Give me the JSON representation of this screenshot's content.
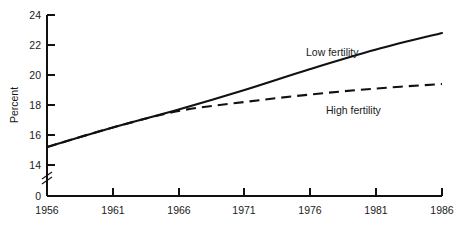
{
  "chart_data": {
    "type": "line",
    "title": "",
    "xlabel": "",
    "ylabel": "Percent",
    "xlim": [
      1956,
      1986
    ],
    "ylim": [
      14,
      24
    ],
    "y_axis_broken": true,
    "y_break_between": [
      0,
      14
    ],
    "grid": false,
    "legend_position": "inline-annotation",
    "xticks": [
      "1956",
      "1961",
      "1966",
      "1971",
      "1976",
      "1981",
      "1986"
    ],
    "xtick_values": [
      1956,
      1961,
      1966,
      1971,
      1976,
      1981,
      1986
    ],
    "yticks": [
      "0",
      "14",
      "16",
      "18",
      "20",
      "22",
      "24"
    ],
    "ytick_values": [
      0,
      14,
      16,
      18,
      20,
      22,
      24
    ],
    "x": [
      1956,
      1961,
      1966,
      1971,
      1976,
      1981,
      1986
    ],
    "series": [
      {
        "name": "Low fertility",
        "style": "solid",
        "color": "#111111",
        "values": [
          15.2,
          16.5,
          17.7,
          19.0,
          20.4,
          21.7,
          22.8
        ]
      },
      {
        "name": "High fertility",
        "style": "dashed",
        "color": "#111111",
        "values": [
          15.2,
          16.5,
          17.6,
          18.2,
          18.7,
          19.1,
          19.4
        ]
      }
    ],
    "annotations": [
      {
        "text": "Low fertility",
        "x": 1976,
        "y": 21.8
      },
      {
        "text": "High fertility",
        "x": 1978,
        "y": 18.0
      }
    ]
  },
  "axis": {
    "y_label": "Percent",
    "ytick_0": "0",
    "ytick_14": "14",
    "ytick_16": "16",
    "ytick_18": "18",
    "ytick_20": "20",
    "ytick_22": "22",
    "ytick_24": "24",
    "xtick_1956": "1956",
    "xtick_1961": "1961",
    "xtick_1966": "1966",
    "xtick_1971": "1971",
    "xtick_1976": "1976",
    "xtick_1981": "1981",
    "xtick_1986": "1986"
  },
  "labels": {
    "low_fertility": "Low fertility",
    "high_fertility": "High fertility"
  }
}
